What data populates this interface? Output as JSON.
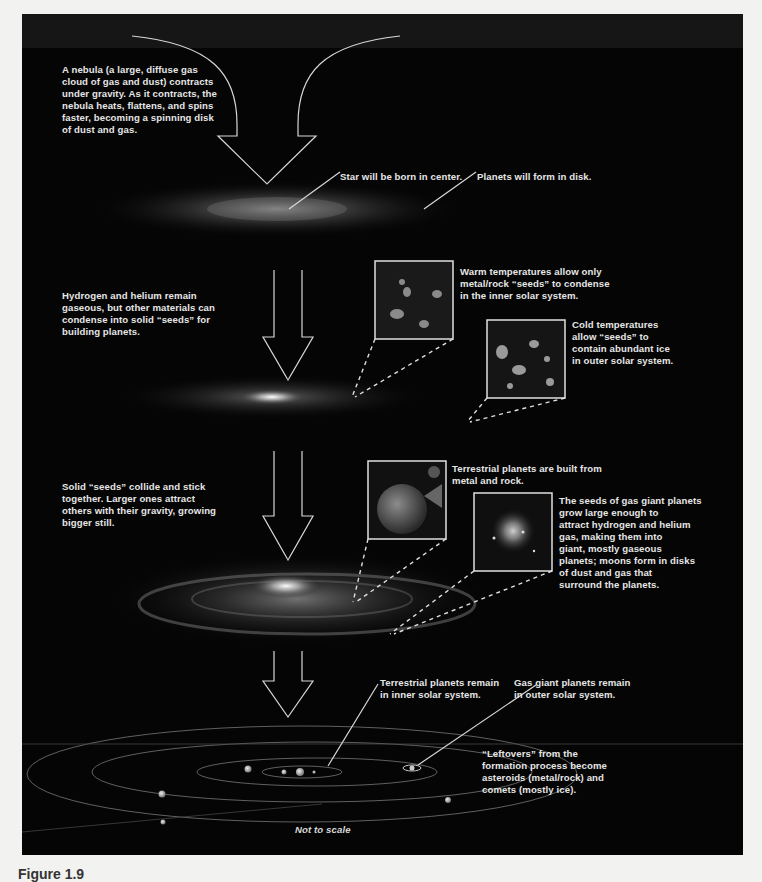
{
  "figure": {
    "caption": "Figure 1.9",
    "colors": {
      "panel": "#050505",
      "page": "#f2f2f0",
      "text": "#e6e6e6",
      "lines": "#d8d8d8"
    },
    "steps": [
      {
        "id": 1,
        "text": "A nebula (a large, diffuse gas\ncloud of gas and dust) contracts\nunder gravity. As it contracts, the\nnebula heats, flattens, and spins\nfaster, becoming a spinning disk\nof dust and gas."
      },
      {
        "id": 2,
        "text": "Hydrogen and helium remain\ngaseous, but other materials can\ncondense into solid “seeds” for\nbuilding planets."
      },
      {
        "id": 3,
        "text": "Solid “seeds” collide and stick\ntogether. Larger ones attract\nothers with their gravity, growing\nbigger still."
      }
    ],
    "callouts": {
      "star_center": "Star will be born in center.",
      "planets_disk": "Planets will form in disk.",
      "warm": "Warm temperatures allow only\nmetal/rock “seeds” to  condense\nin the inner solar system.",
      "cold": "Cold temperatures\nallow “seeds” to\ncontain abundant ice\nin outer solar system.",
      "terrestrial_built": "Terrestrial planets are built from\nmetal and rock.",
      "gas_giant_seeds": "The seeds of gas giant planets\ngrow large enough to\nattract hydrogen and helium\ngas, making them into\ngiant, mostly gaseous\nplanets; moons form in disks\nof dust and gas that\nsurround the planets.",
      "terrestrial_remain": "Terrestrial planets remain\nin inner solar system.",
      "gas_giant_remain": "Gas giant planets remain\nin outer solar system.",
      "leftovers": "“Leftovers” from the\nformation process become\nasteroids (metal/rock) and\ncomets (mostly ice)."
    },
    "note": "Not to scale"
  }
}
